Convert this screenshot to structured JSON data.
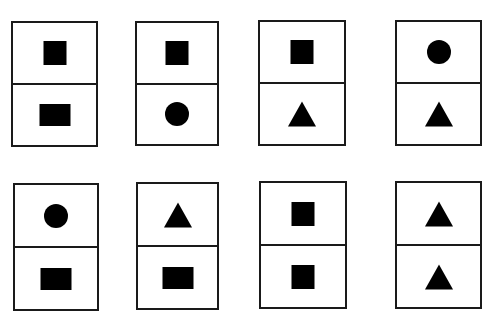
{
  "title": "",
  "rows": [
    {
      "cards": [
        {
          "top": "square",
          "bottom": "rectangle"
        },
        {
          "top": "square",
          "bottom": "circle"
        },
        {
          "top": "square",
          "bottom": "triangle"
        },
        {
          "top": "circle",
          "bottom": "triangle"
        }
      ]
    },
    {
      "cards": [
        {
          "top": "circle",
          "bottom": "rectangle"
        },
        {
          "top": "triangle",
          "bottom": "rectangle"
        },
        {
          "top": "square",
          "bottom": "square"
        },
        {
          "top": "triangle",
          "bottom": "triangle"
        }
      ]
    }
  ],
  "colors": {
    "shape": "#000000",
    "border": "#1a1a1a",
    "background": "#ffffff"
  }
}
